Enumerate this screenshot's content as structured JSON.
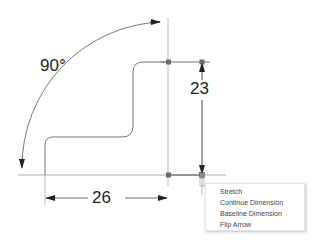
{
  "drawing": {
    "angle_dimension": "90°",
    "width_dimension": "26",
    "height_dimension": "23",
    "line_color": "#777777",
    "dim_color": "#444444",
    "grip_color": "#666666"
  },
  "context_menu": {
    "items": [
      {
        "label": "Stretch"
      },
      {
        "label": "Continue Dimension"
      },
      {
        "label": "Baseline Dimension"
      },
      {
        "label": "Flip Arrow"
      }
    ]
  }
}
